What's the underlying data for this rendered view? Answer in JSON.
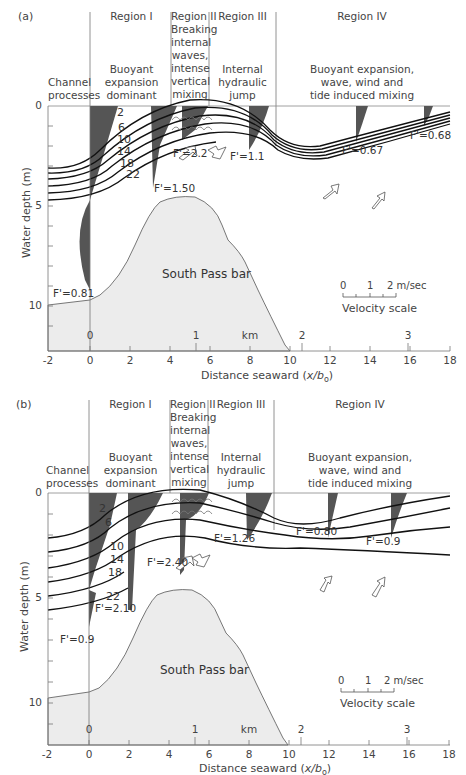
{
  "figure": {
    "panels": [
      {
        "id": "a",
        "label": "(a)",
        "regions": {
          "channel": [
            "Channel",
            "processes"
          ],
          "region1_title": "Region I",
          "region1_desc": [
            "Buoyant",
            "expansion",
            "dominant"
          ],
          "region2_title": "Region II",
          "region2_desc": [
            "Breaking",
            "internal",
            "waves,",
            "intense",
            "vertical",
            "mixing"
          ],
          "region3_title": "Region III",
          "region3_desc": [
            "Internal",
            "hydraulic",
            "jump"
          ],
          "region4_title": "Region IV",
          "region4_desc": [
            "Buoyant expansion,",
            "wave, wind and",
            "tide induced mixing"
          ]
        },
        "isopycnals": [
          "2",
          "6",
          "10",
          "14",
          "18",
          "22"
        ],
        "froude": [
          "F'=0.81",
          "F'=1.50",
          "F'=2.2",
          "F'=1.1",
          "F'=0.67",
          "F'=0.68"
        ],
        "bar_label": "South Pass bar"
      },
      {
        "id": "b",
        "label": "(b)",
        "regions": {
          "channel": [
            "Channel",
            "processes"
          ],
          "region1_title": "Region I",
          "region1_desc": [
            "Buoyant",
            "expansion",
            "dominant"
          ],
          "region2_title": "Region II",
          "region2_desc": [
            "Breaking",
            "internal",
            "waves,",
            "intense",
            "vertical",
            "mixing"
          ],
          "region3_title": "Region III",
          "region3_desc": [
            "Internal",
            "hydraulic",
            "jump"
          ],
          "region4_title": "Region IV",
          "region4_desc": [
            "Buoyant expansion,",
            "wave, wind and",
            "tide induced mixing"
          ]
        },
        "isopycnals": [
          "2",
          "6",
          "10",
          "14",
          "18",
          "22"
        ],
        "froude": [
          "F'=0.9",
          "F'=2.10",
          "F'=2.40",
          "F'=1.26",
          "F'=0.80",
          "F'=0.9"
        ],
        "bar_label": "South Pass bar"
      }
    ],
    "axes": {
      "x_ticks": [
        "-2",
        "0",
        "2",
        "4",
        "6",
        "8",
        "10",
        "12",
        "14",
        "16",
        "18"
      ],
      "x_label_main": "Distance seaward (",
      "x_label_var": "x/b",
      "x_label_sub": "o",
      "x_label_close": ")",
      "y_ticks": [
        "0",
        "5",
        "10"
      ],
      "y_label": "Water depth (m)",
      "km_ticks": [
        "0",
        "1",
        "2",
        "3"
      ],
      "km_label": "km"
    },
    "velocity_scale": {
      "ticks": [
        "0",
        "1",
        "2 m/sec"
      ],
      "label": "Velocity scale"
    },
    "colors": {
      "bar_fill": "#ececec",
      "profile_fill": "#555555",
      "line": "#111111"
    }
  }
}
